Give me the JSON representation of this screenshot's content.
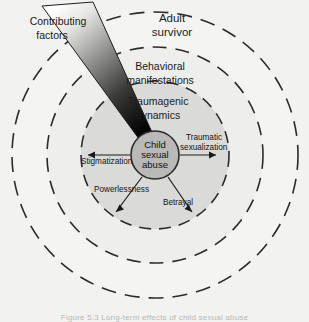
{
  "figure": {
    "title_alt": "Concentric model of the effects of child sexual abuse",
    "background_color": "#f2f2f0"
  },
  "rings": [
    {
      "id": "adult-survivor",
      "label_line1": "Adult",
      "label_line2": "survivor",
      "radius": 143,
      "fill": "#f4f4f2",
      "stroke": "#2b2b2b"
    },
    {
      "id": "behavioral-manifestations",
      "label_line1": "Behavioral",
      "label_line2": "manifestations",
      "radius": 108,
      "fill": "#eeeeec",
      "stroke": "#2b2b2b"
    },
    {
      "id": "traumagenic-dynamics",
      "label_line1": "Traumagenic",
      "label_line2": "dynamics",
      "radius": 74,
      "fill": "#dcdcda",
      "stroke": "#2b2b2b"
    }
  ],
  "core": {
    "id": "child-sexual-abuse",
    "label_line1": "Child",
    "label_line2": "sexual",
    "label_line3": "abuse",
    "radius": 24,
    "fill": "#b9b9b7",
    "stroke": "#2b2b2b"
  },
  "wedge": {
    "id": "contributing-factors",
    "label_line1": "Contributing",
    "label_line2": "factors",
    "gradient_from": "#ffffff",
    "gradient_to": "#050505"
  },
  "dynamics": [
    {
      "id": "traumatic-sexualization",
      "label_line1": "Traumatic",
      "label_line2": "sexualization",
      "direction": "right"
    },
    {
      "id": "stigmatization",
      "label_line1": "Stigmatization",
      "label_line2": "",
      "direction": "left"
    },
    {
      "id": "powerlessness",
      "label_line1": "Powerlessness",
      "label_line2": "",
      "direction": "down-left"
    },
    {
      "id": "betrayal",
      "label_line1": "Betrayal",
      "label_line2": "",
      "direction": "down-right"
    }
  ],
  "caption": {
    "text": "Figure 5.3 Long-term effects of child sexual abuse"
  }
}
